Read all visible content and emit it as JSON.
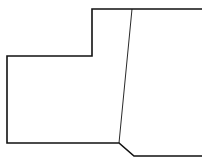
{
  "diagram": {
    "stroke_color": "#111111",
    "background": "#ffffff",
    "outline_path": "M 202 9 L 92 9 L 92 56 L 7 56 L 7 143 L 119 143 L 134 156 L 202 156",
    "divider_line": {
      "x1": 132,
      "y1": 9,
      "x2": 119,
      "y2": 143
    }
  }
}
